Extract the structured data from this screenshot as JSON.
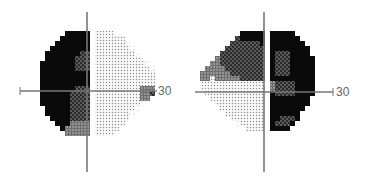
{
  "chart_data": [
    {
      "type": "heatmap",
      "title": "",
      "description": "Visual field grayscale plot (30-degree field) - left eye pattern",
      "axis_max_label": "30",
      "axes": {
        "x_range": [
          -30,
          30
        ],
        "y_range": [
          -30,
          30
        ],
        "tick_interval_deg": 10
      },
      "legend_codes": {
        "B": "black (absolute defect)",
        "D": "dark dotted",
        "M": "medium gray",
        "L": "light dotted",
        ".": "faint dots",
        " ": "outside field"
      },
      "origin": {
        "x": 35,
        "y": 31
      },
      "cell": 5,
      "rows": [
        "      BBBBB LLLL        ",
        "     BBBBBB LLLLLL      ",
        "    BBBBBBB LLLLLL.     ",
        "   BBBBBBBB LLLLLLL.    ",
        "  BBBBBBBDD LLLLLLLL.   ",
        "  BBBBBBDDD LLLLLLLLL.  ",
        " BBBBBBBDDD LLLLLLLLLL. ",
        " BBBBBBBDDD LLLLLLLLLLL.",
        " BBBBBBBBBB LLLLLLLLLLLL",
        " BBBBBBBBBB LLLLLLLLLLLL",
        " BBBBBBBBBB LLLLLLLLLLLL",
        " BBBBBBBDDD LLLLLLLLLMMM",
        " BBBBBBDDDD LLLLLLLLLMMD",
        " BBBBBBDDDD LLLLLLLLLMM ",
        " BBBBBBDDDD LLLLLLLLL.  ",
        "  BBBBBDDDD LLLLLLLL.   ",
        "  BBBBBDDDD LLLLLLL.    ",
        "   BBBBDDDD LLLLLLL     ",
        "    BBBMMMM LLLLLL      ",
        "     BMMMMM LLLLL       ",
        "      MMMMM LLLL        "
      ]
    },
    {
      "type": "heatmap",
      "title": "",
      "description": "Visual field grayscale plot (30-degree field) - right eye pattern",
      "axis_max_label": "30",
      "axes": {
        "x_range": [
          -30,
          30
        ],
        "y_range": [
          -30,
          30
        ],
        "tick_interval_deg": 10
      },
      "legend_codes": {
        "B": "black (absolute defect)",
        "D": "dark dotted",
        "M": "medium gray",
        "L": "light dotted",
        ".": "faint dots",
        " ": "outside field"
      },
      "origin": {
        "x": 195,
        "y": 31
      },
      "cell": 5,
      "rows": [
        "         BBBBB BBBBB     ",
        "        DBBBBB BBBBBB    ",
        "       DDDDDDB BBBBBBB   ",
        "      DDDDDDDD BBBBBBBB  ",
        "     DDDDDDDDD BDDDBBBB  ",
        "    MDDDDDDDDD BDDDBBBBB ",
        "   MMDDDDDDDDD BDDDBBBBB ",
        "  MMMMDDDDDDDD BDDDBBBBB ",
        " MMMMMMDDDDDDD BDDDBBBBB ",
        " MMLMMMMMDDDDD BBBBBBBBB ",
        " LLLLLLLLLLLLL MDDDDBBBB ",
        " LLLLLLLLLLLLL MDDDDBBBB ",
        "  LLLLLLLLLLLL BDDDDBBBB ",
        "   LLLLLLLLLLL BBBBBBBB  ",
        "    LLLLLLLLLL BBBBBBBB  ",
        "     LLLLLLLLL BBBBBBB   ",
        "      LLLLLLLL BBBBBB    ",
        "       LLLLLLL BBDDDB    ",
        "        .LLLLL BDDDB     ",
        "          LLLL BBBB      "
      ]
    }
  ],
  "charts": [
    {
      "axis_label": "30"
    },
    {
      "axis_label": "30"
    }
  ]
}
